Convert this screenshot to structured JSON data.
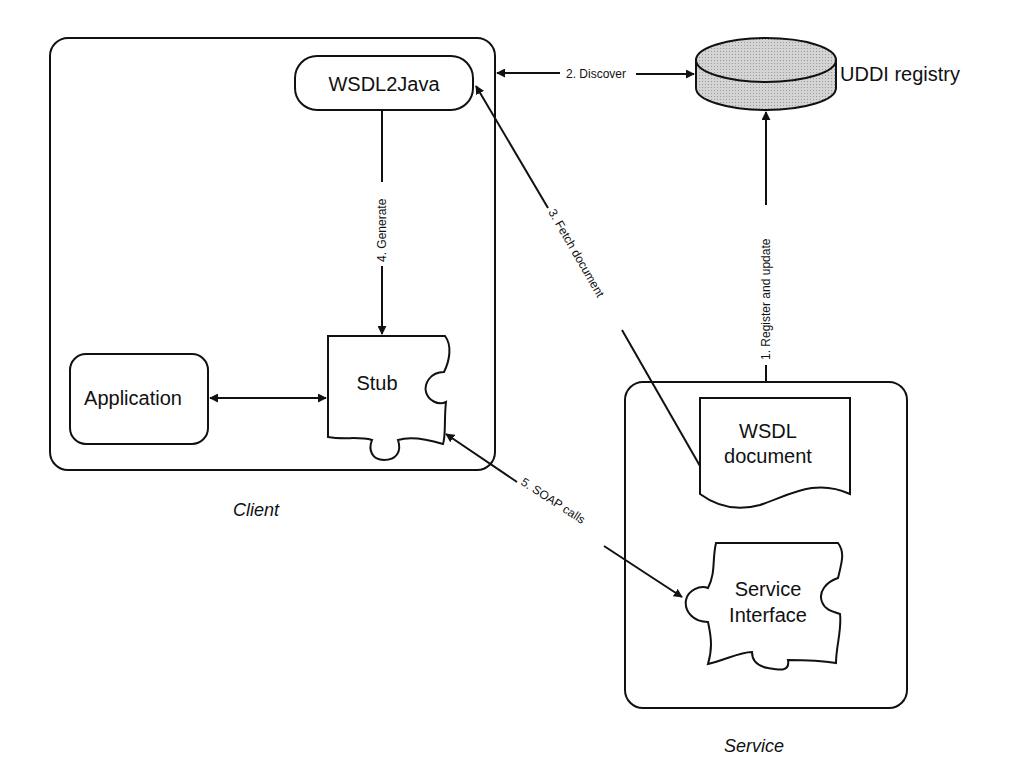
{
  "diagram": {
    "containers": {
      "client": {
        "caption": "Client"
      },
      "service": {
        "caption": "Service"
      }
    },
    "nodes": {
      "wsdl2java": {
        "label": "WSDL2Java"
      },
      "application": {
        "label": "Application"
      },
      "stub": {
        "label": "Stub"
      },
      "uddi": {
        "label": "UDDI registry",
        "fill": "#cfcfcf"
      },
      "wsdl_document": {
        "line1": "WSDL",
        "line2": "document"
      },
      "service_interface": {
        "line1": "Service",
        "line2": "Interface"
      }
    },
    "edges": {
      "register": {
        "label": "1. Register and update"
      },
      "discover": {
        "label": "2. Discover"
      },
      "fetch": {
        "label": "3. Fetch document"
      },
      "generate": {
        "label": "4. Generate"
      },
      "soap": {
        "label": "5. SOAP calls"
      }
    }
  }
}
